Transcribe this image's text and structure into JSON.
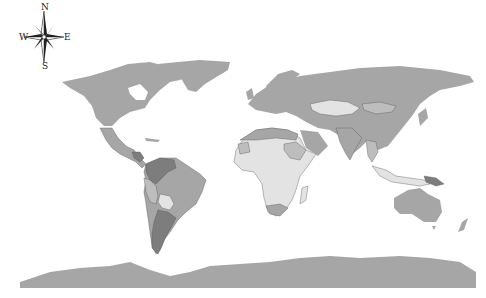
{
  "map": {
    "type": "choropleth world map",
    "projection": "equirectangular",
    "background": "#ffffff",
    "colors": {
      "default_land": "#a6a6a6",
      "light_category": "#e3e3e3",
      "medium_category": "#bdbdbd",
      "dark_category": "#7d7d7d",
      "border": "#555555"
    },
    "compass": {
      "north": "N",
      "south": "S",
      "east": "E",
      "west": "W"
    },
    "highlighted_regions": {
      "dark": [
        "Venezuela",
        "Colombia",
        "Argentina",
        "Honduras",
        "Nicaragua",
        "Papua New Guinea"
      ],
      "light": [
        "Kazakhstan",
        "Bolivia",
        "Algeria",
        "Mali",
        "Niger",
        "Chad",
        "Nigeria",
        "Central African Republic",
        "DR Congo",
        "Angola",
        "Zambia",
        "Tanzania",
        "Kenya",
        "Madagascar",
        "Mozambique",
        "Namibia",
        "Botswana",
        "Indonesia",
        "Myanmar"
      ],
      "medium": [
        "Mongolia",
        "Sudan",
        "Ethiopia",
        "Mauritania",
        "Peru",
        "Ecuador",
        "Thailand"
      ]
    }
  }
}
